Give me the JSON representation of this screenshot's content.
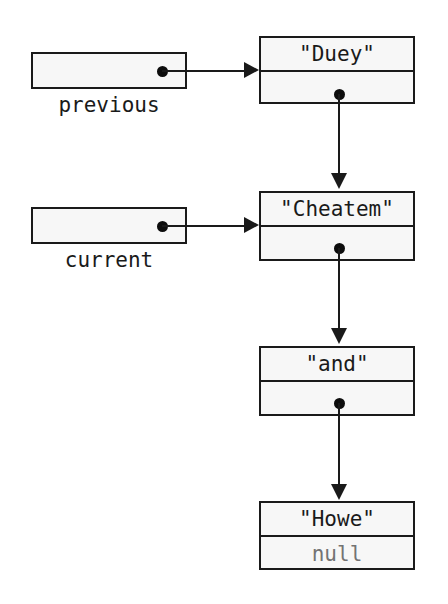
{
  "diagram": {
    "background_color": "#ffffff",
    "stroke_color": "#1a1a1a",
    "node_fill_color": "#f7f7f7",
    "null_text_color": "#737373",
    "variables": [
      {
        "label": "previous",
        "points_to": "Duey"
      },
      {
        "label": "current",
        "points_to": "Cheatem"
      }
    ],
    "nodes": [
      {
        "value": "\"Duey\"",
        "next": "link-dot"
      },
      {
        "value": "\"Cheatem\"",
        "next": "link-dot"
      },
      {
        "value": "\"and\"",
        "next": "link-dot"
      },
      {
        "value": "\"Howe\"",
        "next": "null"
      }
    ]
  }
}
